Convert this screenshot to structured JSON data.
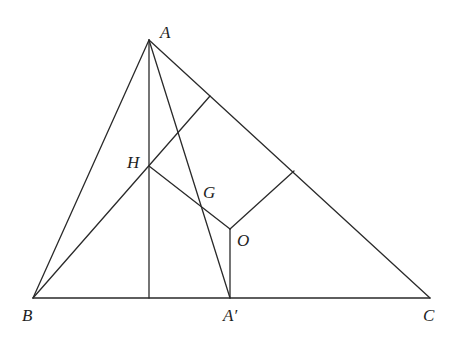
{
  "diagram": {
    "stroke_color": "#2a2a2a",
    "label_color": "#1e1e1e",
    "background": "#ffffff",
    "points": {
      "A": {
        "x": 149,
        "y": 40
      },
      "B": {
        "x": 33,
        "y": 298
      },
      "C": {
        "x": 430,
        "y": 298
      },
      "A_prime": {
        "x": 230,
        "y": 298
      },
      "H": {
        "x": 149,
        "y": 166
      },
      "G": {
        "x": 203,
        "y": 208
      },
      "O": {
        "x": 230,
        "y": 229
      },
      "foot_A": {
        "x": 149,
        "y": 298
      },
      "foot_B": {
        "x": 210,
        "y": 96
      },
      "mid_AC": {
        "x": 294,
        "y": 171
      }
    },
    "segments": [
      {
        "name": "side-ab",
        "from": "A",
        "to": "B"
      },
      {
        "name": "side-ac",
        "from": "A",
        "to": "C"
      },
      {
        "name": "side-bc",
        "from": "B",
        "to": "C"
      },
      {
        "name": "altitude-from-a",
        "from": "A",
        "to": "foot_A"
      },
      {
        "name": "median-from-a",
        "from": "A",
        "to": "A_prime"
      },
      {
        "name": "altitude-from-b",
        "from": "B",
        "to": "foot_B"
      },
      {
        "name": "euler-line-ho",
        "from": "H",
        "to": "O"
      },
      {
        "name": "perp-bisector-bc",
        "from": "O",
        "to": "A_prime"
      },
      {
        "name": "perp-bisector-ac",
        "from": "O",
        "to": "mid_AC"
      }
    ],
    "labels": {
      "A": {
        "text": "A",
        "x": 160,
        "y": 24
      },
      "B": {
        "text": "B",
        "x": 22,
        "y": 307
      },
      "C": {
        "text": "C",
        "x": 423,
        "y": 307
      },
      "A_prime": {
        "text": "A′",
        "x": 223,
        "y": 307
      },
      "H": {
        "text": "H",
        "x": 127,
        "y": 154
      },
      "G": {
        "text": "G",
        "x": 203,
        "y": 184
      },
      "O": {
        "text": "O",
        "x": 237,
        "y": 232
      }
    }
  }
}
